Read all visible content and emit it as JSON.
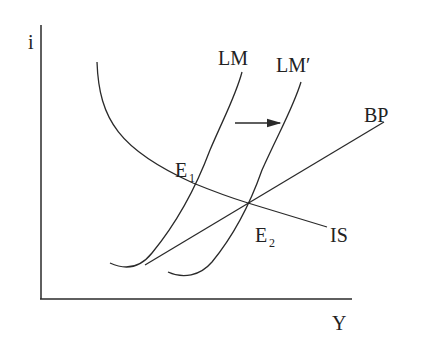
{
  "diagram": {
    "type": "IS-LM-BP",
    "axes": {
      "y_label": "i",
      "x_label": "Y"
    },
    "curves": {
      "is": "IS",
      "lm": "LM",
      "lm_shifted": "LM′",
      "bp": "BP"
    },
    "points": {
      "e1_main": "E",
      "e1_sub": "1",
      "e2_main": "E",
      "e2_sub": "2"
    },
    "annotations": {
      "shift_arrow": "LM shifts right to LM′"
    }
  }
}
